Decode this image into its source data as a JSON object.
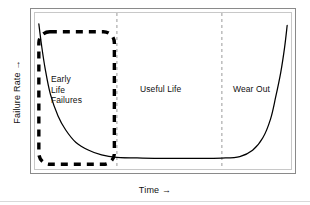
{
  "figure": {
    "background_color": "#ffffff",
    "frame_color": "#8a8a8a",
    "plot_frame_color": "#c8c8c8",
    "curve_color": "#000000",
    "divider_color": "#9a9a9a",
    "highlight_color": "#000000"
  },
  "axes": {
    "y_label": "Failure Rate →",
    "x_label": "Time →"
  },
  "zones": [
    {
      "id": "early-life-failures",
      "label": "Early\nLife\nFailures"
    },
    {
      "id": "useful-life",
      "label": "Useful Life"
    },
    {
      "id": "wear-out",
      "label": "Wear Out"
    }
  ],
  "chart_data": {
    "type": "line",
    "xlabel": "Time →",
    "ylabel": "Failure Rate →",
    "grid": false,
    "legend": "none",
    "xlim": [
      0,
      100
    ],
    "ylim": [
      0,
      100
    ],
    "axis_ticks": "none",
    "regions": [
      {
        "name": "Early Life Failures",
        "x_start": 0,
        "x_end": 32,
        "label_x": 9,
        "label_y": 58
      },
      {
        "name": "Useful Life",
        "x_start": 32,
        "x_end": 73,
        "label_x": 45,
        "label_y": 52
      },
      {
        "name": "Wear Out",
        "x_start": 73,
        "x_end": 100,
        "label_x": 80,
        "label_y": 52
      }
    ],
    "region_dividers_x": [
      32,
      73
    ],
    "highlight_box": {
      "label": "Early Life Failures region emphasis",
      "style": "thick dashed rounded rectangle",
      "x_start": 1.5,
      "x_end": 31,
      "y_bottom": 3,
      "y_top": 88
    },
    "series": [
      {
        "name": "Failure Rate",
        "style": "solid",
        "points": [
          {
            "x": 1.5,
            "y": 93
          },
          {
            "x": 2.5,
            "y": 80
          },
          {
            "x": 4,
            "y": 64
          },
          {
            "x": 6,
            "y": 48
          },
          {
            "x": 9,
            "y": 34
          },
          {
            "x": 12,
            "y": 25
          },
          {
            "x": 16,
            "y": 17
          },
          {
            "x": 21,
            "y": 12
          },
          {
            "x": 26,
            "y": 9
          },
          {
            "x": 32,
            "y": 7.5
          },
          {
            "x": 42,
            "y": 7
          },
          {
            "x": 52,
            "y": 6.8
          },
          {
            "x": 62,
            "y": 6.8
          },
          {
            "x": 73,
            "y": 7
          },
          {
            "x": 80,
            "y": 8
          },
          {
            "x": 85,
            "y": 12
          },
          {
            "x": 89,
            "y": 20
          },
          {
            "x": 92,
            "y": 32
          },
          {
            "x": 94,
            "y": 46
          },
          {
            "x": 96,
            "y": 62
          },
          {
            "x": 97.5,
            "y": 78
          },
          {
            "x": 98.5,
            "y": 92
          }
        ]
      }
    ]
  }
}
